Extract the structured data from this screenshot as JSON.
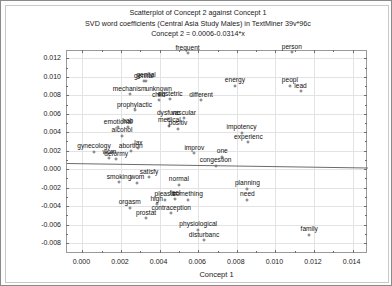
{
  "window": {
    "kind": "statistica-graph-window"
  },
  "chart_data": {
    "type": "scatter",
    "title": "Scatterplot of Concept 2 against Concept 1",
    "subtitle": "SVD word coefficients (Central Asia Study Males) in TextMiner 39v*96c",
    "equation": "Concept 2 = 0.0006-0.0314*x",
    "xlabel": "Concept 1",
    "ylabel": "Concept 2",
    "xlim": [
      -0.0008,
      0.0148
    ],
    "ylim": [
      -0.0092,
      0.0128
    ],
    "xticks": [
      "0.000",
      "0.002",
      "0.004",
      "0.006",
      "0.008",
      "0.010",
      "0.012",
      "0.014"
    ],
    "xtick_values": [
      0.0,
      0.002,
      0.004,
      0.006,
      0.008,
      0.01,
      0.012,
      0.014
    ],
    "yticks": [
      "0.012",
      "0.010",
      "0.008",
      "0.006",
      "0.004",
      "0.002",
      "0.000",
      "-0.002",
      "-0.004",
      "-0.006",
      "-0.008"
    ],
    "ytick_values": [
      0.012,
      0.01,
      0.008,
      0.006,
      0.004,
      0.002,
      0.0,
      -0.002,
      -0.004,
      -0.006,
      -0.008
    ],
    "grid": true,
    "legend": "none",
    "fit_line": {
      "intercept": 0.0006,
      "slope": -0.0314
    },
    "points": [
      {
        "label": "frequent",
        "x": 0.00545,
        "y": 0.01255
      },
      {
        "label": "person",
        "x": 0.01085,
        "y": 0.01265
      },
      {
        "label": "genital",
        "x": 0.0033,
        "y": 0.0096
      },
      {
        "label": "genital",
        "x": 0.00318,
        "y": 0.00955
      },
      {
        "label": "energy",
        "x": 0.0079,
        "y": 0.00905
      },
      {
        "label": "peopl",
        "x": 0.01075,
        "y": 0.00905
      },
      {
        "label": "lead",
        "x": 0.0113,
        "y": 0.00845
      },
      {
        "label": "mechanism",
        "x": 0.00245,
        "y": 0.0081
      },
      {
        "label": "unknown",
        "x": 0.00395,
        "y": 0.0081
      },
      {
        "label": "obstetric",
        "x": 0.00455,
        "y": 0.0076
      },
      {
        "label": "child",
        "x": 0.00395,
        "y": 0.00745
      },
      {
        "label": "different",
        "x": 0.00615,
        "y": 0.00745
      },
      {
        "label": "prophylactic",
        "x": 0.0027,
        "y": 0.0064
      },
      {
        "label": "dysfunc",
        "x": 0.00445,
        "y": 0.00545
      },
      {
        "label": "vascular",
        "x": 0.00525,
        "y": 0.0055
      },
      {
        "label": "medical",
        "x": 0.0045,
        "y": 0.0047
      },
      {
        "label": "positiv",
        "x": 0.00495,
        "y": 0.0044
      },
      {
        "label": "emotional",
        "x": 0.00185,
        "y": 0.00455
      },
      {
        "label": "hab",
        "x": 0.00235,
        "y": 0.0046
      },
      {
        "label": "alcohol",
        "x": 0.00205,
        "y": 0.0036
      },
      {
        "label": "impotency",
        "x": 0.00825,
        "y": 0.00395
      },
      {
        "label": "experienc",
        "x": 0.0086,
        "y": 0.0029
      },
      {
        "label": "gynecology",
        "x": 0.0006,
        "y": 0.0019
      },
      {
        "label": "abortion",
        "x": 0.0025,
        "y": 0.00195
      },
      {
        "label": "lax",
        "x": 0.0029,
        "y": 0.00225
      },
      {
        "label": "wom",
        "x": 0.0014,
        "y": 0.00125
      },
      {
        "label": "deformy",
        "x": 0.00175,
        "y": 0.0011
      },
      {
        "label": "improv",
        "x": 0.0058,
        "y": 0.00175
      },
      {
        "label": "one",
        "x": 0.00725,
        "y": 0.00135
      },
      {
        "label": "congestion",
        "x": 0.0069,
        "y": 0.00035
      },
      {
        "label": "satisfy",
        "x": 0.00345,
        "y": -0.0009
      },
      {
        "label": "smoking",
        "x": 0.0019,
        "y": -0.0014
      },
      {
        "label": "wom",
        "x": 0.00285,
        "y": -0.0015
      },
      {
        "label": "normal",
        "x": 0.005,
        "y": -0.0017
      },
      {
        "label": "planning",
        "x": 0.00855,
        "y": -0.00215
      },
      {
        "label": "need",
        "x": 0.00855,
        "y": -0.0033
      },
      {
        "label": "pleasur",
        "x": 0.0043,
        "y": -0.0033
      },
      {
        "label": "feel",
        "x": 0.0048,
        "y": -0.0032
      },
      {
        "label": "something",
        "x": 0.00545,
        "y": -0.0033
      },
      {
        "label": "orgasm",
        "x": 0.00245,
        "y": -0.0042
      },
      {
        "label": "high",
        "x": 0.00385,
        "y": -0.0038
      },
      {
        "label": "contraception",
        "x": 0.0046,
        "y": -0.0048
      },
      {
        "label": "prostat",
        "x": 0.0033,
        "y": -0.0053
      },
      {
        "label": "physiological",
        "x": 0.006,
        "y": -0.00655
      },
      {
        "label": "disturbanc",
        "x": 0.0063,
        "y": -0.0077
      },
      {
        "label": "family",
        "x": 0.01175,
        "y": -0.0071
      }
    ]
  }
}
